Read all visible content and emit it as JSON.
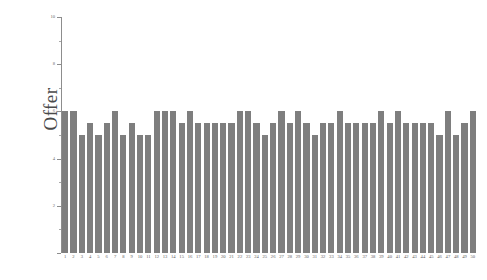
{
  "chart_data": {
    "type": "bar",
    "title": "",
    "xlabel": "",
    "ylabel": "Offer",
    "ylim": [
      0,
      10
    ],
    "yticks": [
      0,
      2,
      4,
      6,
      8,
      10
    ],
    "ytick_labels": [
      "0",
      "2",
      "4",
      "6",
      "8",
      "10"
    ],
    "y_minor_ticks": [
      1,
      3,
      5,
      7,
      9
    ],
    "grid": false,
    "legend": null,
    "bar_color": "#7e7e7e",
    "axis_color": "#8d8d8d",
    "categories": [
      "1",
      "2",
      "3",
      "4",
      "5",
      "6",
      "7",
      "8",
      "9",
      "10",
      "11",
      "12",
      "13",
      "14",
      "15",
      "16",
      "17",
      "18",
      "19",
      "20",
      "21",
      "22",
      "23",
      "24",
      "25",
      "26",
      "27",
      "28",
      "29",
      "30",
      "31",
      "32",
      "33",
      "34",
      "35",
      "36",
      "37",
      "38",
      "39",
      "40",
      "41",
      "42",
      "43",
      "44",
      "45",
      "46",
      "47",
      "48",
      "49",
      "50"
    ],
    "values": [
      6,
      6,
      5,
      5.5,
      5,
      5.5,
      6,
      5,
      5.5,
      5,
      5,
      6,
      6,
      6,
      5.5,
      6,
      5.5,
      5.5,
      5.5,
      5.5,
      5.5,
      6,
      6,
      5.5,
      5,
      5.5,
      6,
      5.5,
      6,
      5.5,
      5,
      5.5,
      5.5,
      6,
      5.5,
      5.5,
      5.5,
      5.5,
      6,
      5.5,
      6,
      5.5,
      5.5,
      5.5,
      5.5,
      5,
      6,
      5,
      5.5,
      6
    ]
  }
}
